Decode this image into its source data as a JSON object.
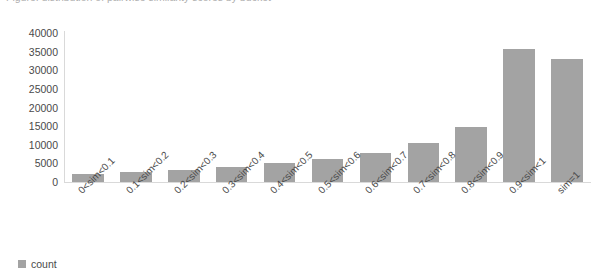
{
  "title_sliver": "Figure: distribution of pairwise similarity scores by bucket",
  "legend": {
    "label": "count",
    "swatch_color": "#a3a3a3",
    "position": "bottom-left"
  },
  "axis": {
    "y_ticks": [
      "40000",
      "35000",
      "30000",
      "25000",
      "20000",
      "15000",
      "10000",
      "5000",
      "0"
    ],
    "y_min": 0,
    "y_max": 40000,
    "y_step": 5000,
    "grid": false
  },
  "colors": {
    "bar": "#a3a3a3",
    "axis": "#d9d9d9",
    "text": "#4a4a4a",
    "background": "#ffffff"
  },
  "chart_data": {
    "type": "bar",
    "title": "",
    "xlabel": "",
    "ylabel": "",
    "ylim": [
      0,
      40000
    ],
    "grid": false,
    "legend_position": "bottom-left",
    "categories": [
      "0<sim<0.1",
      "0.1<sim<0.2",
      "0.2<sim<0.3",
      "0.3<sim<0.4",
      "0.4<sim<0.5",
      "0.5<sim<0.6",
      "0.6<sim<0.7",
      "0.7<sim<0.8",
      "0.8<sim<0.9",
      "0.9<sim<1",
      "sim=1"
    ],
    "series": [
      {
        "name": "count",
        "color": "#a3a3a3",
        "values": [
          2200,
          2800,
          3200,
          4000,
          5000,
          6300,
          7800,
          10500,
          14800,
          35700,
          33000
        ]
      }
    ]
  }
}
